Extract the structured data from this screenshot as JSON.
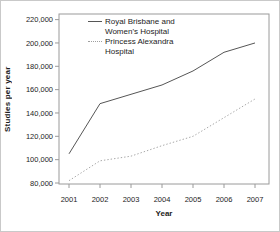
{
  "figure": {
    "background": "#ffffff",
    "border_color": "#c9c9c9"
  },
  "colors": {
    "axis": "#9a9a9a",
    "text": "#1c1c1c"
  },
  "chart_data": {
    "type": "line",
    "title": "",
    "xlabel": "Year",
    "ylabel": "Studies per year",
    "x": [
      "2001",
      "2002",
      "2003",
      "2004",
      "2005",
      "2006",
      "2007"
    ],
    "series": [
      {
        "name": "Royal Brisbane and Women's Hospital",
        "style": "solid",
        "color": "#565656",
        "values": [
          105000,
          148000,
          156000,
          164000,
          176000,
          192000,
          200000
        ]
      },
      {
        "name": "Princess Alexandra Hospital",
        "style": "dotted",
        "color": "#a8a8a8",
        "values": [
          82000,
          99000,
          103000,
          112000,
          120000,
          136000,
          152000
        ]
      }
    ],
    "ylim": [
      80000,
      220000
    ],
    "yticks": [
      80000,
      100000,
      120000,
      140000,
      160000,
      180000,
      200000,
      220000
    ],
    "ytick_labels": [
      "80,000",
      "100,000",
      "120,000",
      "140,000",
      "160,000",
      "180,000",
      "200,000",
      "220,000"
    ],
    "grid": false,
    "legend_position": "top-left-inside"
  },
  "legend": {
    "items": [
      {
        "label_line1": "Royal Brisbane and",
        "label_line2": "Women's Hospital",
        "style": "solid"
      },
      {
        "label_line1": "Princess Alexandra",
        "label_line2": "Hospital",
        "style": "dotted"
      }
    ]
  }
}
